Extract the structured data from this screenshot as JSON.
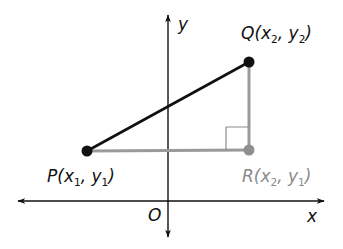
{
  "diagram": {
    "type": "coordinate-plane-right-triangle",
    "axes": {
      "x_label": "x",
      "y_label": "y",
      "origin_label": "O"
    },
    "points": {
      "P": {
        "name": "P",
        "x_sub": "1",
        "y_sub": "1",
        "label_prefix": "P(x",
        "label_mid": ", y",
        "label_end": ")",
        "color": "#111111"
      },
      "Q": {
        "name": "Q",
        "x_sub": "2",
        "y_sub": "2",
        "label_prefix": "Q(x",
        "label_mid": ", y",
        "label_end": ")",
        "color": "#111111"
      },
      "R": {
        "name": "R",
        "x_sub": "2",
        "y_sub": "1",
        "label_prefix": "R(x",
        "label_mid": ", y",
        "label_end": ")",
        "color": "#8a8a8a"
      }
    },
    "segments": [
      {
        "from": "P",
        "to": "Q",
        "color": "#111111"
      },
      {
        "from": "P",
        "to": "R",
        "color": "#9a9a9a"
      },
      {
        "from": "R",
        "to": "Q",
        "color": "#9a9a9a"
      }
    ],
    "right_angle_at": "R",
    "colors": {
      "axis": "#111111",
      "hypotenuse": "#111111",
      "legs": "#9a9a9a",
      "right_angle_marker": "#8a8a8a"
    }
  }
}
